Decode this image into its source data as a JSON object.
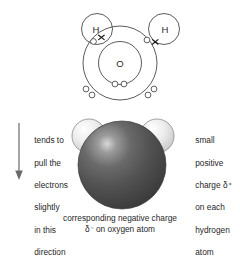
{
  "figure": {
    "background_color": "#ffffff"
  },
  "lewis_diagram": {
    "oxygen_label": "O",
    "hydrogen_left_label": "H",
    "hydrogen_right_label": "H",
    "shell_stroke_color": "#4a4a4a",
    "electron_fill_color": "#ffffff",
    "electron_stroke_color": "#444444",
    "cross_color": "#111111",
    "inner_shell_electrons": 2,
    "outer_shell_lone_electrons": 4,
    "bonding_pairs": 2,
    "cross_symbol": "x",
    "description": "oxygen atom with inner and outer electron shells sharing electrons with two hydrogen atoms"
  },
  "space_filling_model": {
    "oxygen_color": "#4f4f4f",
    "oxygen_highlight_color": "#cfcfcf",
    "hydrogen_color": "#e8e8e8",
    "hydrogen_highlight_color": "#fdfdfd",
    "outline_color": "#6e6e6e",
    "atoms": [
      "O",
      "H",
      "H"
    ]
  },
  "annotations": {
    "left": {
      "name": "electron-pull-annotation",
      "lines": [
        "tends to",
        "pull the",
        "electrons",
        "slightly",
        "in this",
        "direction"
      ],
      "arrow": {
        "name": "downward-arrow",
        "direction": "down",
        "color": "#6a6a6a"
      }
    },
    "right": {
      "name": "partial-positive-annotation",
      "lines": [
        "small",
        "positive",
        "charge δ⁺",
        "on each",
        "hydrogen",
        "atom"
      ]
    },
    "caption": {
      "name": "partial-negative-caption",
      "line1": "corresponding negative charge",
      "line2": "δ⁻ on oxygen atom"
    }
  }
}
